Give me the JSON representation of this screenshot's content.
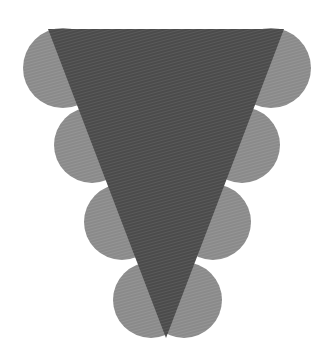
{
  "figure": {
    "colors": {
      "background": "#ffffff",
      "triangle": "#4b4b4b",
      "triangle_stripe": "#5a5a5a",
      "circle": "#8a8a8a",
      "circle_stripe": "#959595"
    },
    "triangle": {
      "points": [
        [
          48,
          29
        ],
        [
          284,
          29
        ],
        [
          166,
          338
        ]
      ]
    },
    "circles_left": [
      {
        "cx": 63,
        "cy": 68,
        "r": 40
      },
      {
        "cx": 92,
        "cy": 145,
        "r": 38
      },
      {
        "cx": 122,
        "cy": 222,
        "r": 38
      },
      {
        "cx": 151,
        "cy": 300,
        "r": 38
      }
    ],
    "circles_right": [
      {
        "cx": 271,
        "cy": 68,
        "r": 40
      },
      {
        "cx": 242,
        "cy": 145,
        "r": 38
      },
      {
        "cx": 213,
        "cy": 222,
        "r": 38
      },
      {
        "cx": 184,
        "cy": 300,
        "r": 38
      }
    ]
  }
}
